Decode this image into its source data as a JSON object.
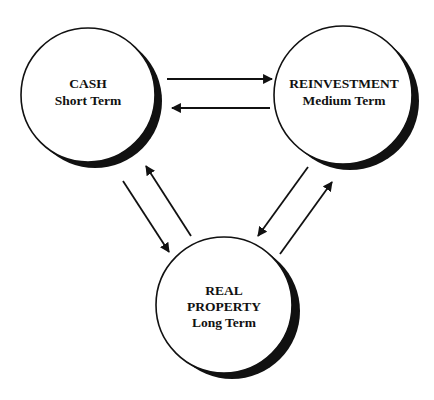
{
  "diagram": {
    "nodes": [
      {
        "id": "cash",
        "title": "CASH",
        "subtitle": "Short Term"
      },
      {
        "id": "reinvestment",
        "title": "REINVESTMENT",
        "subtitle": "Medium Term"
      },
      {
        "id": "real_property",
        "title": "REAL",
        "title2": "PROPERTY",
        "subtitle": "Long Term"
      }
    ],
    "edges": [
      {
        "from": "cash",
        "to": "reinvestment"
      },
      {
        "from": "reinvestment",
        "to": "cash"
      },
      {
        "from": "cash",
        "to": "real_property"
      },
      {
        "from": "real_property",
        "to": "cash"
      },
      {
        "from": "reinvestment",
        "to": "real_property"
      },
      {
        "from": "real_property",
        "to": "reinvestment"
      }
    ],
    "colors": {
      "stroke": "#111111",
      "fill": "#ffffff",
      "shadow": "#111111"
    }
  }
}
